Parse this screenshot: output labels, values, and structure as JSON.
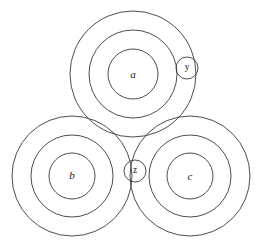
{
  "diagram": {
    "type": "venn-nested-circles",
    "canvas": {
      "width": 271,
      "height": 247,
      "background": "#ffffff"
    },
    "style": {
      "stroke": "#3a3a3a",
      "stroke_width": 0.9,
      "label_color": "#1a1a1a"
    },
    "groups": [
      {
        "id": "group-a",
        "label": "a",
        "label_position": {
          "x": 133,
          "y": 75
        },
        "center": {
          "x": 133,
          "y": 74
        },
        "radii": [
          63,
          44,
          25
        ]
      },
      {
        "id": "group-b",
        "label": "b",
        "label_position": {
          "x": 72,
          "y": 176
        },
        "center": {
          "x": 72,
          "y": 176
        },
        "radii": [
          60,
          41,
          23
        ]
      },
      {
        "id": "group-c",
        "label": "c",
        "label_position": {
          "x": 190,
          "y": 177
        },
        "center": {
          "x": 190,
          "y": 176
        },
        "radii": [
          60,
          41,
          23
        ]
      }
    ],
    "points": [
      {
        "id": "point-y",
        "label": "y",
        "center": {
          "x": 187,
          "y": 68
        },
        "radius": 11,
        "label_position": {
          "x": 187,
          "y": 68
        }
      },
      {
        "id": "point-z",
        "label": "z",
        "center": {
          "x": 135,
          "y": 171
        },
        "radius": 11,
        "label_position": {
          "x": 135,
          "y": 171
        }
      }
    ]
  },
  "chart_data": {
    "type": "scatter",
    "xlabel": "",
    "ylabel": "",
    "xlim": [
      0,
      271
    ],
    "ylim": [
      0,
      247
    ],
    "grid": false,
    "legend": "none",
    "annotations": [
      "a",
      "b",
      "c",
      "y",
      "z"
    ],
    "series": [
      {
        "name": "a",
        "center_x": 133,
        "center_y": 74,
        "radii": [
          63,
          44,
          25
        ],
        "ring_count": 3
      },
      {
        "name": "b",
        "center_x": 72,
        "center_y": 176,
        "radii": [
          60,
          41,
          23
        ],
        "ring_count": 3
      },
      {
        "name": "c",
        "center_x": 190,
        "center_y": 176,
        "radii": [
          60,
          41,
          23
        ],
        "ring_count": 3
      },
      {
        "name": "y",
        "center_x": 187,
        "center_y": 68,
        "radii": [
          11
        ],
        "ring_count": 1
      },
      {
        "name": "z",
        "center_x": 135,
        "center_y": 171,
        "radii": [
          11
        ],
        "ring_count": 1
      }
    ]
  }
}
